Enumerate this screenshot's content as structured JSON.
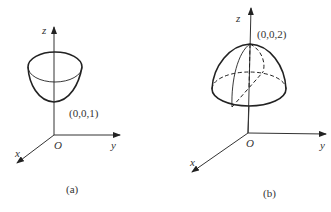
{
  "figures": [
    {
      "id": "a",
      "caption": "(a)",
      "surface": "paraboloid opening upward (bowl)",
      "point_label": "(0,0,1)",
      "axes": {
        "x": "x",
        "y": "y",
        "z": "z",
        "origin": "O"
      }
    },
    {
      "id": "b",
      "caption": "(b)",
      "surface": "paraboloid opening downward (dome)",
      "point_label": "(0,0,2)",
      "axes": {
        "x": "x",
        "y": "y",
        "z": "z",
        "origin": "O"
      }
    }
  ],
  "colors": {
    "ink": "#222222",
    "background": "#ffffff"
  }
}
